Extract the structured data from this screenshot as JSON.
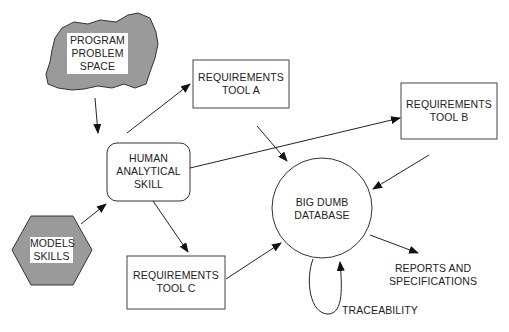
{
  "diagram": {
    "colors": {
      "stroke": "#333333",
      "fill_gray": "#9a9a9a",
      "background": "#ffffff"
    },
    "nodes": {
      "problem_space": {
        "shape": "cloud",
        "lines": [
          "PROGRAM",
          "PROBLEM",
          "SPACE"
        ]
      },
      "models_skills": {
        "shape": "hexagon",
        "lines": [
          "MODELS",
          "SKILLS"
        ]
      },
      "human_skill": {
        "shape": "rounded-rect",
        "lines": [
          "HUMAN",
          "ANALYTICAL",
          "SKILL"
        ]
      },
      "tool_a": {
        "shape": "rect",
        "lines": [
          "REQUIREMENTS",
          "TOOL A"
        ]
      },
      "tool_b": {
        "shape": "rect",
        "lines": [
          "REQUIREMENTS",
          "TOOL B"
        ]
      },
      "tool_c": {
        "shape": "rect",
        "lines": [
          "REQUIREMENTS",
          "TOOL C"
        ]
      },
      "database": {
        "shape": "circle",
        "lines": [
          "BIG DUMB",
          "DATABASE"
        ]
      },
      "reports": {
        "shape": "text",
        "lines": [
          "REPORTS AND",
          "SPECIFICATIONS"
        ]
      },
      "traceability": {
        "shape": "text",
        "lines": [
          "TRACEABILITY"
        ]
      }
    },
    "edges": [
      {
        "from": "problem_space",
        "to": "human_skill"
      },
      {
        "from": "models_skills",
        "to": "human_skill"
      },
      {
        "from": "human_skill",
        "to": "tool_a"
      },
      {
        "from": "human_skill",
        "to": "tool_b"
      },
      {
        "from": "human_skill",
        "to": "tool_c"
      },
      {
        "from": "tool_a",
        "to": "database"
      },
      {
        "from": "tool_b",
        "to": "database"
      },
      {
        "from": "tool_c",
        "to": "database"
      },
      {
        "from": "database",
        "to": "reports"
      },
      {
        "from": "database",
        "to": "database",
        "label": "traceability"
      }
    ]
  }
}
